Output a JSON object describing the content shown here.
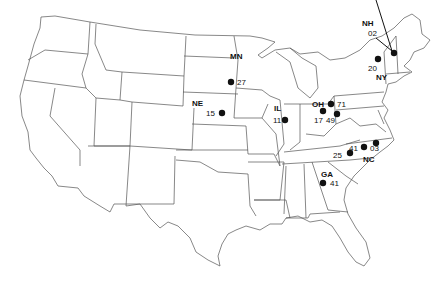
{
  "map": {
    "title": "United States study site map",
    "colors": {
      "outline": "#555555",
      "marker": "#111111",
      "background": "#ffffff"
    },
    "states": [
      {
        "abbr": "MN",
        "sites": [
          {
            "id": "27"
          }
        ]
      },
      {
        "abbr": "NE",
        "sites": [
          {
            "id": "15"
          }
        ]
      },
      {
        "abbr": "IL",
        "sites": [
          {
            "id": "11"
          }
        ]
      },
      {
        "abbr": "OH",
        "sites": [
          {
            "id": "71"
          },
          {
            "id": "17"
          },
          {
            "id": "49"
          }
        ]
      },
      {
        "abbr": "NH",
        "sites": [
          {
            "id": "02"
          }
        ]
      },
      {
        "abbr": "NY",
        "sites": [
          {
            "id": "20"
          }
        ]
      },
      {
        "abbr": "NC",
        "sites": [
          {
            "id": "41"
          },
          {
            "id": "03"
          },
          {
            "id": "25"
          }
        ]
      },
      {
        "abbr": "GA",
        "sites": [
          {
            "id": "41"
          }
        ]
      }
    ]
  }
}
